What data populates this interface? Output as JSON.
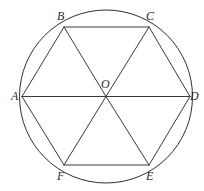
{
  "figure": {
    "canvas": {
      "width": 204,
      "height": 191,
      "background": "#ffffff"
    },
    "stroke": {
      "color": "#3a3a3a",
      "circle_color": "#2f2f2f",
      "width": 1
    },
    "circle": {
      "cx": 106,
      "cy": 96.5,
      "r": 86.5
    },
    "center_point": {
      "id": "O",
      "x": 106,
      "y": 96.5
    },
    "vertices": [
      {
        "id": "A",
        "x": 22,
        "y": 96.5,
        "label": "A",
        "label_x": 11,
        "label_y": 90
      },
      {
        "id": "B",
        "x": 64,
        "y": 27,
        "label": "B",
        "label_x": 57,
        "label_y": 10
      },
      {
        "id": "C",
        "x": 149,
        "y": 27,
        "label": "C",
        "label_x": 146,
        "label_y": 10
      },
      {
        "id": "D",
        "x": 190,
        "y": 96.5,
        "label": "D",
        "label_x": 190,
        "label_y": 90
      },
      {
        "id": "E",
        "x": 149,
        "y": 165,
        "label": "E",
        "label_x": 146,
        "label_y": 170
      },
      {
        "id": "F",
        "x": 64,
        "y": 165,
        "label": "F",
        "label_x": 57,
        "label_y": 170
      }
    ],
    "center_label": {
      "label": "O",
      "x": 101,
      "y": 78
    },
    "hexagon_edges": [
      [
        "A",
        "B"
      ],
      [
        "B",
        "C"
      ],
      [
        "C",
        "D"
      ],
      [
        "D",
        "E"
      ],
      [
        "E",
        "F"
      ],
      [
        "F",
        "A"
      ]
    ],
    "radii": [
      [
        "O",
        "A"
      ],
      [
        "O",
        "B"
      ],
      [
        "O",
        "C"
      ],
      [
        "O",
        "D"
      ],
      [
        "O",
        "E"
      ],
      [
        "O",
        "F"
      ]
    ],
    "labels_text": [
      "A",
      "B",
      "C",
      "D",
      "E",
      "F",
      "O"
    ]
  }
}
